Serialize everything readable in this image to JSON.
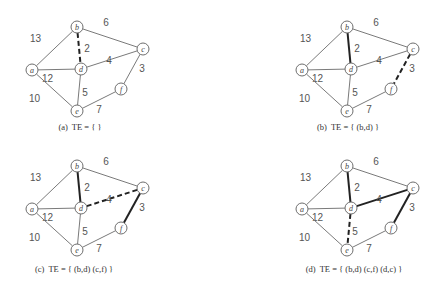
{
  "nodes": [
    "a",
    "b",
    "c",
    "d",
    "e",
    "f"
  ],
  "edges": [
    {
      "from": "a",
      "to": "b",
      "weight": "13"
    },
    {
      "from": "b",
      "to": "c",
      "weight": "6"
    },
    {
      "from": "b",
      "to": "d",
      "weight": "2"
    },
    {
      "from": "a",
      "to": "d",
      "weight": "12"
    },
    {
      "from": "d",
      "to": "c",
      "weight": "4"
    },
    {
      "from": "c",
      "to": "f",
      "weight": "3"
    },
    {
      "from": "a",
      "to": "e",
      "weight": "10"
    },
    {
      "from": "d",
      "to": "e",
      "weight": "5"
    },
    {
      "from": "e",
      "to": "f",
      "weight": "7"
    }
  ],
  "panels": [
    {
      "id": "a",
      "caption_prefix": "(a)",
      "caption": "TE = { }",
      "tree_edges": [],
      "candidate_edge": [
        "b",
        "d"
      ]
    },
    {
      "id": "b",
      "caption_prefix": "(b)",
      "caption": "TE = { (b,d) }",
      "tree_edges": [
        [
          "b",
          "d"
        ]
      ],
      "candidate_edge": [
        "c",
        "f"
      ]
    },
    {
      "id": "c",
      "caption_prefix": "(c)",
      "caption": "TE = { (b,d) (c,f) }",
      "tree_edges": [
        [
          "b",
          "d"
        ],
        [
          "c",
          "f"
        ]
      ],
      "candidate_edge": [
        "d",
        "c"
      ]
    },
    {
      "id": "d",
      "caption_prefix": "(d)",
      "caption": "TE = { (b,d) (c,f) (d,c) }",
      "tree_edges": [
        [
          "b",
          "d"
        ],
        [
          "c",
          "f"
        ],
        [
          "d",
          "c"
        ]
      ],
      "candidate_edge": [
        "d",
        "e"
      ]
    }
  ],
  "colors": {
    "edge": "#7a7a7a",
    "tree_edge": "#222222",
    "node_stroke": "#6e6e6e",
    "text": "#555555"
  }
}
